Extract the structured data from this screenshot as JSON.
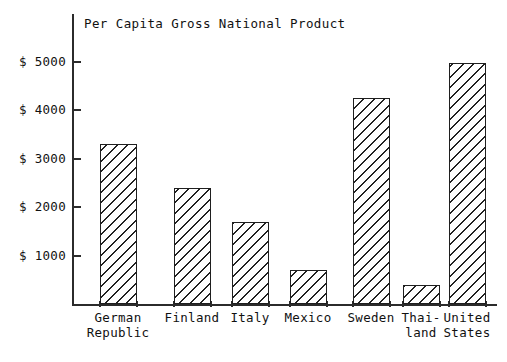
{
  "chart_data": {
    "type": "bar",
    "title": "Per Capita Gross National Product",
    "xlabel": "",
    "ylabel": "",
    "ylim": [
      0,
      5500
    ],
    "grid": false,
    "legend": null,
    "currency_prefix": "$",
    "categories": [
      "German\nRepublic",
      "Finland",
      "Italy",
      "Mexico",
      "Sweden",
      "Thai-\nland",
      "United\nStates"
    ],
    "values": [
      3300,
      2400,
      1700,
      700,
      4250,
      400,
      4970
    ],
    "ytick_labels": [
      "$ 5000",
      "$ 4000",
      "$ 3000",
      "$ 2000",
      "$ 1000"
    ],
    "ytick_values": [
      5000,
      4000,
      3000,
      2000,
      1000
    ],
    "bar_style": "diagonal-hatch",
    "bar_edge_color": "#1f1f1f",
    "bar_fill_color": "#ffffff",
    "axis_color": "#2b2b2b"
  }
}
